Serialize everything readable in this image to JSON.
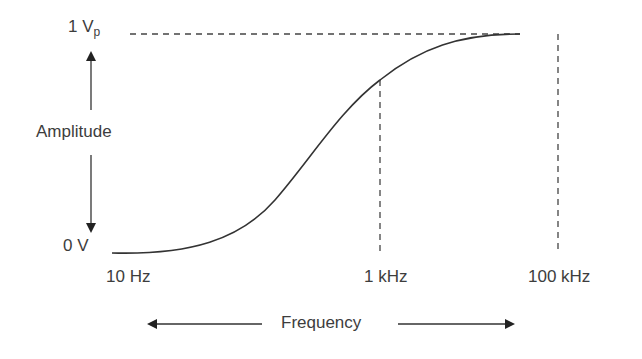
{
  "diagram": {
    "y_axis": {
      "label": "Amplitude",
      "top_label": "1 V",
      "top_label_sub": "p",
      "bottom_label": "0 V"
    },
    "x_axis": {
      "label": "Frequency",
      "ticks": [
        "10 Hz",
        "1 kHz",
        "100 kHz"
      ]
    },
    "curve": {
      "description": "S-shaped rising frequency response from 0 V at 10 Hz to 1 Vp plateau before 100 kHz",
      "type": "sigmoid"
    },
    "colors": {
      "line": "#3a3a3a",
      "text": "#3d3d3d"
    }
  }
}
